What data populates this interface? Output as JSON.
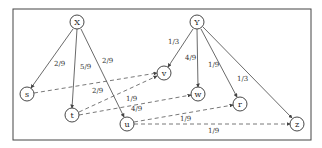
{
  "diagram": {
    "type": "directed-graph",
    "nodes": {
      "X": {
        "label": "X",
        "cx": 77,
        "cy": 22
      },
      "Y": {
        "label": "Y",
        "cx": 197,
        "cy": 22
      },
      "s": {
        "label": "s",
        "cx": 27,
        "cy": 94
      },
      "t": {
        "label": "t",
        "cx": 72,
        "cy": 115
      },
      "u": {
        "label": "u",
        "cx": 127,
        "cy": 124
      },
      "v": {
        "label": "v",
        "cx": 164,
        "cy": 73
      },
      "w": {
        "label": "w",
        "cx": 198,
        "cy": 94
      },
      "r": {
        "label": "r",
        "cx": 240,
        "cy": 104
      },
      "z": {
        "label": "z",
        "cx": 297,
        "cy": 124
      }
    },
    "solid_edges": [
      {
        "from": "X",
        "to": "s",
        "label": "2/9"
      },
      {
        "from": "X",
        "to": "t",
        "label": "5/9"
      },
      {
        "from": "X",
        "to": "u",
        "label": "2/9"
      },
      {
        "from": "Y",
        "to": "v",
        "label": "1/3"
      },
      {
        "from": "Y",
        "to": "w",
        "label": "4/9"
      },
      {
        "from": "Y",
        "to": "r",
        "label": "1/9"
      },
      {
        "from": "Y",
        "to": "z",
        "label": "1/3"
      }
    ],
    "dashed_edges": [
      {
        "from": "s",
        "to": "v",
        "label": "2/9"
      },
      {
        "from": "t",
        "to": "v",
        "label": "1/9"
      },
      {
        "from": "t",
        "to": "w",
        "label": "4/9"
      },
      {
        "from": "u",
        "to": "r",
        "label": "1/9"
      },
      {
        "from": "u",
        "to": "z",
        "label": "1/9"
      }
    ]
  }
}
